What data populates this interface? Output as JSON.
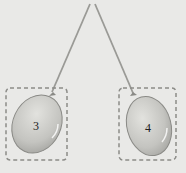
{
  "diagram": {
    "balloons": [
      {
        "label": "3"
      },
      {
        "label": "4"
      }
    ],
    "colors": {
      "background": "#e9e9e7",
      "balloon": "#c8c8c4",
      "string": "#9a9a96",
      "dash": "#8c8c88"
    }
  }
}
